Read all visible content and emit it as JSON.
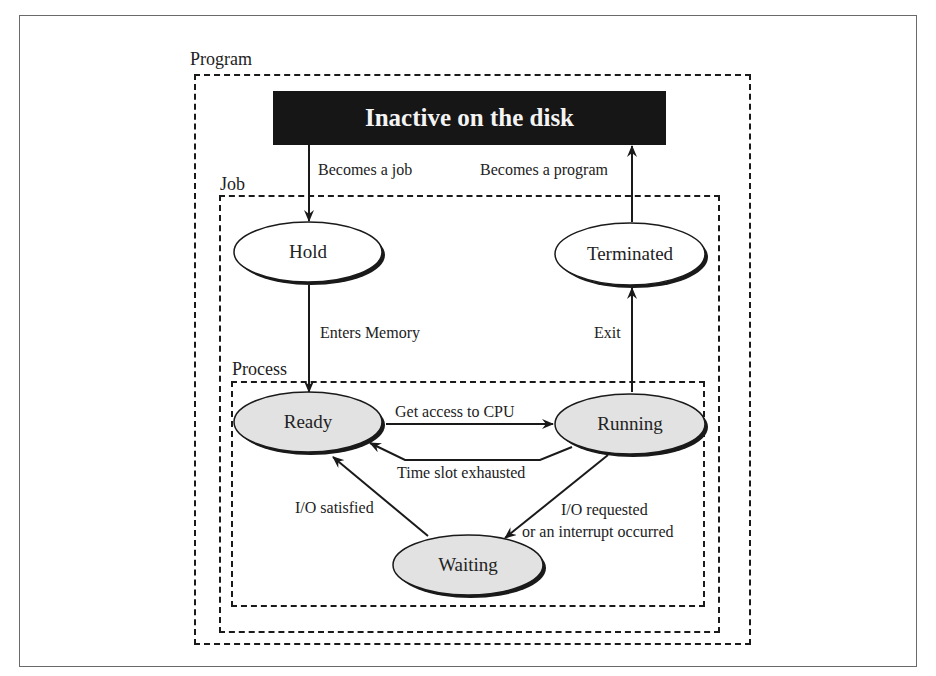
{
  "diagram": {
    "type": "state-transition",
    "containers": {
      "program": {
        "label": "Program"
      },
      "job": {
        "label": "Job"
      },
      "process": {
        "label": "Process"
      }
    },
    "disk": {
      "label": "Inactive on the disk"
    },
    "states": {
      "hold": {
        "label": "Hold",
        "fill": "#ffffff"
      },
      "terminated": {
        "label": "Terminated",
        "fill": "#ffffff"
      },
      "ready": {
        "label": "Ready",
        "fill": "#e2e2e2"
      },
      "running": {
        "label": "Running",
        "fill": "#e2e2e2"
      },
      "waiting": {
        "label": "Waiting",
        "fill": "#e2e2e2"
      }
    },
    "transitions": {
      "becomes_job": {
        "label": "Becomes a job",
        "from": "Inactive on the disk",
        "to": "Hold"
      },
      "becomes_program": {
        "label": "Becomes a program",
        "from": "Terminated",
        "to": "Inactive on the disk"
      },
      "enters_memory": {
        "label": "Enters Memory",
        "from": "Hold",
        "to": "Ready"
      },
      "exit": {
        "label": "Exit",
        "from": "Running",
        "to": "Terminated"
      },
      "get_cpu": {
        "label": "Get access to CPU",
        "from": "Ready",
        "to": "Running"
      },
      "time_slot": {
        "label": "Time slot exhausted",
        "from": "Running",
        "to": "Ready"
      },
      "io_satisfied": {
        "label": "I/O satisfied",
        "from": "Waiting",
        "to": "Ready"
      },
      "io_requested_line1": {
        "label": "I/O requested"
      },
      "io_requested_line2": {
        "label": "or an interrupt occurred",
        "from": "Running",
        "to": "Waiting"
      }
    }
  }
}
